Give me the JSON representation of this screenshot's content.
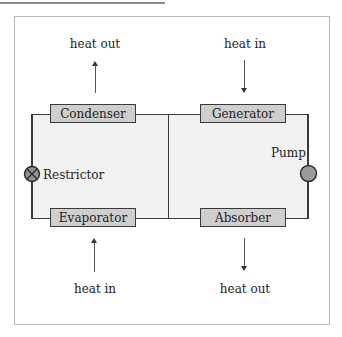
{
  "diagram": {
    "type": "absorption refrigeration cycle",
    "components": {
      "condenser": "Condenser",
      "generator": "Generator",
      "evaporator": "Evaporator",
      "absorber": "Absorber"
    },
    "devices": {
      "restrictor": "Restrictor",
      "pump": "Pump"
    },
    "heat_flows": {
      "condenser": "heat out",
      "generator": "heat in",
      "evaporator": "heat in",
      "absorber": "heat out"
    },
    "colors": {
      "box_fill": "#cfcfcf",
      "line": "#3a3a3a",
      "circuit_fill": "#f2f2f2",
      "pump_fill": "#9a9a9a",
      "restrictor_fill": "#8f8f8f",
      "frame_border": "#b8b8b8"
    }
  }
}
